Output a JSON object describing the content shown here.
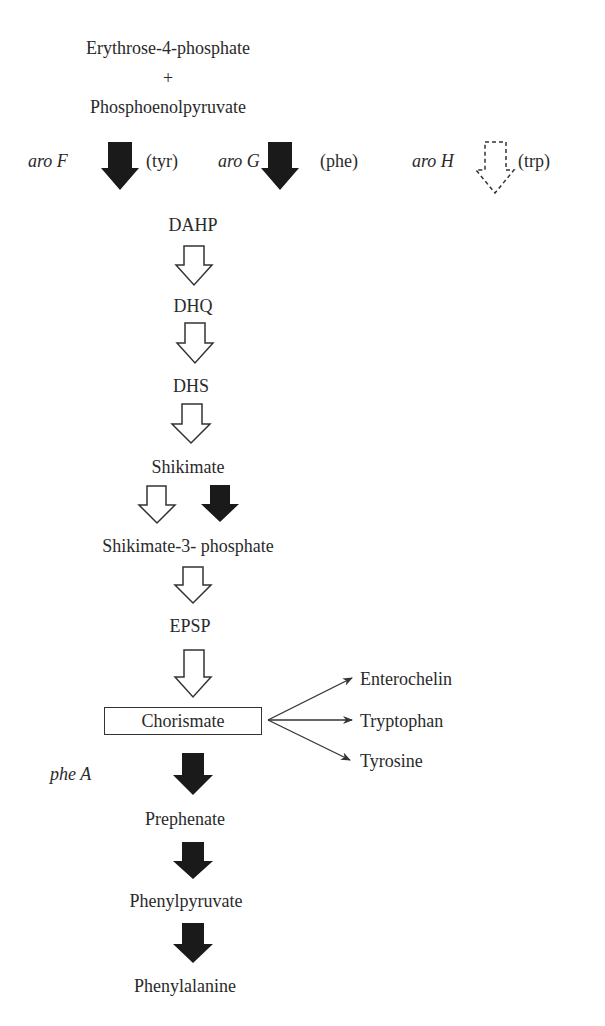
{
  "substrates": {
    "first": "Erythrose-4-phosphate",
    "plus": "+",
    "second": "Phosphoenolpyruvate"
  },
  "isoenzymes": [
    {
      "gene": "aro F",
      "regulator": "(tyr)",
      "arrow_style": "filled"
    },
    {
      "gene": "aro G",
      "regulator": "(phe)",
      "arrow_style": "filled"
    },
    {
      "gene": "aro H",
      "regulator": "(trp)",
      "arrow_style": "dashed-open"
    }
  ],
  "intermediates": [
    {
      "name": "DAHP"
    },
    {
      "name": "DHQ"
    },
    {
      "name": "DHS"
    },
    {
      "name": "Shikimate"
    },
    {
      "name": "Shikimate-3- phosphate"
    },
    {
      "name": "EPSP"
    },
    {
      "name": "Chorismate",
      "boxed": true
    },
    {
      "name": "Prephenate"
    },
    {
      "name": "Phenylpyruvate"
    },
    {
      "name": "Phenylalanine"
    }
  ],
  "branch_products": [
    "Enterochelin",
    "Tryptophan",
    "Tyrosine"
  ],
  "gene_labels": {
    "pheA": "phe A"
  },
  "legend": {
    "filled_arrow": "black filled arrow",
    "open_arrow": "white open arrow",
    "dashed_arrow": "dashed open arrow"
  },
  "colors": {
    "ink": "#2a2a2a",
    "filled_arrow": "#1a1a1a",
    "background": "#ffffff"
  }
}
